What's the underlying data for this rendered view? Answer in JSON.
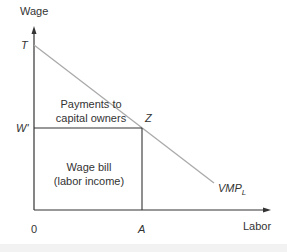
{
  "diagram": {
    "y_axis_label": "Wage",
    "x_axis_label": "Labor",
    "points": {
      "T": "T",
      "W": "W'",
      "Z": "Z",
      "A": "A",
      "origin": "0"
    },
    "curve_label": "VMP",
    "curve_subscript": "L",
    "regions": {
      "upper_line1": "Payments to",
      "upper_line2": "capital owners",
      "lower_line1": "Wage bill",
      "lower_line2": "(labor income)"
    },
    "colors": {
      "axis": "#333333",
      "curve": "#aaaaaa",
      "rectangle": "#333333",
      "text": "#333333"
    }
  }
}
